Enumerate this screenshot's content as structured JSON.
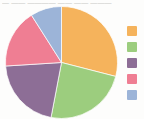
{
  "figure": {
    "caption_remnant": "— —— ———— —— —— ———",
    "background_color": "#fdfdfc"
  },
  "legend": {
    "position": "right",
    "items": [
      {
        "name": "series-1",
        "label": "",
        "color": "#f5b35c"
      },
      {
        "name": "series-2",
        "label": "",
        "color": "#9ccd7e"
      },
      {
        "name": "series-3",
        "label": "",
        "color": "#8d6e96"
      },
      {
        "name": "series-4",
        "label": "",
        "color": "#ef7e93"
      },
      {
        "name": "series-5",
        "label": "",
        "color": "#9cb4d8"
      }
    ]
  },
  "chart_data": {
    "type": "pie",
    "title": "",
    "xlabel": "",
    "ylabel": "",
    "labels": [
      "Series 1",
      "Series 2",
      "Series 3",
      "Series 4",
      "Series 5"
    ],
    "values": [
      29,
      24,
      21,
      17,
      9
    ],
    "units": "percent",
    "total": 100,
    "start_angle_deg": 0,
    "direction": "clockwise",
    "colors": [
      "#f5b35c",
      "#9ccd7e",
      "#8d6e96",
      "#ef7e93",
      "#9cb4d8"
    ],
    "slice_angles_deg": [
      104.4,
      86.4,
      75.6,
      61.2,
      32.4
    ],
    "legend": "right",
    "grid": false,
    "center": {
      "x": 62,
      "y": 62
    },
    "radius": 56
  }
}
